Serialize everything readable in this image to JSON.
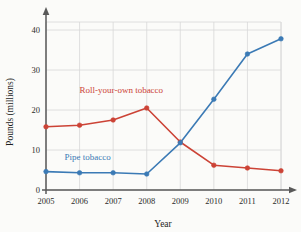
{
  "chart_data": {
    "type": "line",
    "title": "",
    "xlabel": "Year",
    "ylabel": "Pounds (millions)",
    "categories": [
      "2005",
      "2006",
      "2007",
      "2008",
      "2009",
      "2010",
      "2011",
      "2012"
    ],
    "x": [
      2005,
      2006,
      2007,
      2008,
      2009,
      2010,
      2011,
      2012
    ],
    "xlim": [
      2005,
      2012
    ],
    "ylim": [
      0,
      42
    ],
    "yticks": [
      "0",
      "10",
      "20",
      "30",
      "40"
    ],
    "ytick_values": [
      0,
      10,
      20,
      30,
      40
    ],
    "xticks": [
      "2005",
      "2006",
      "2007",
      "2008",
      "2009",
      "2010",
      "2011",
      "2012"
    ],
    "grid": true,
    "legend_position": "inline-annotations",
    "series": [
      {
        "name": "Roll-your-own tobacco",
        "color": "#cc4336",
        "values": [
          15.8,
          16.2,
          17.5,
          20.5,
          12.0,
          6.2,
          5.5,
          4.8
        ],
        "label_text": "Roll-your-own tobacco",
        "label_x": 2006.0,
        "label_y": 24.2
      },
      {
        "name": "Pipe tobacco",
        "color": "#3b7ab5",
        "values": [
          4.6,
          4.3,
          4.3,
          4.0,
          11.8,
          22.7,
          34.0,
          37.8
        ],
        "label_text": "Pipe tobacco",
        "label_x": 2005.55,
        "label_y": 7.6
      }
    ],
    "annotations": [
      {
        "name": "roll-your-own-label",
        "text": "Roll-your-own tobacco",
        "color": "#cc4336"
      },
      {
        "name": "pipe-tobacco-label",
        "text": "Pipe tobacco",
        "color": "#3b7ab5"
      }
    ],
    "style": {
      "background": "#fbfbf9",
      "grid_color": "#d8d8d8",
      "axis_color": "#595959",
      "text_color": "#2b2b2b",
      "marker": "circle",
      "line_width": 1.6
    }
  }
}
